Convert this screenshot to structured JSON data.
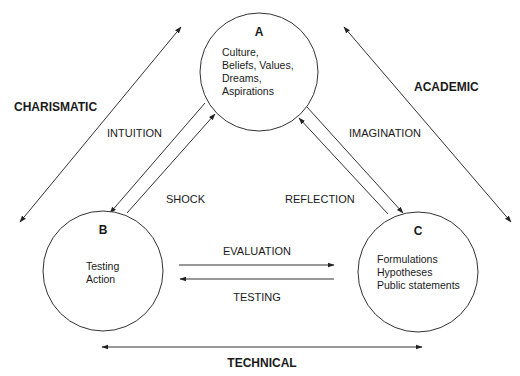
{
  "diagram": {
    "nodes": [
      {
        "id": "A",
        "letter": "A",
        "lines": [
          "Culture,",
          "Beliefs, Values,",
          "Dreams,",
          "Aspirations"
        ]
      },
      {
        "id": "B",
        "letter": "B",
        "lines": [
          "Testing",
          "Action"
        ]
      },
      {
        "id": "C",
        "letter": "C",
        "lines": [
          "Formulations",
          "Hypotheses",
          "Public statements"
        ]
      }
    ],
    "edge_labels": {
      "intuition": "INTUITION",
      "shock": "SHOCK",
      "imagination": "IMAGINATION",
      "reflection": "REFLECTION",
      "evaluation": "EVALUATION",
      "testing": "TESTING"
    },
    "axis_labels": {
      "charismatic": "CHARISMATIC",
      "academic": "ACADEMIC",
      "technical": "TECHNICAL"
    },
    "colors": {
      "line": "#333333",
      "text": "#1a1a1a",
      "background": "#ffffff"
    }
  }
}
